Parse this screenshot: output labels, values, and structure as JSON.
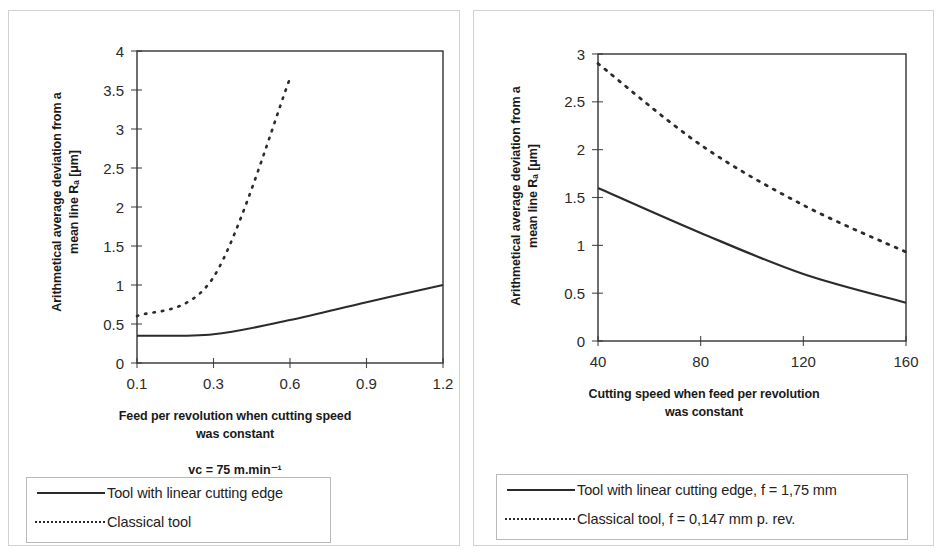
{
  "figure": {
    "panels": [
      {
        "id": "left",
        "y_axis_title_line1": "Arithmetical average deviation from a",
        "y_axis_title_line2": "mean line Rₐ [μm]",
        "x_axis_title_line1": "Feed per revolution when cutting speed",
        "x_axis_title_line2": "was constant",
        "condition_note": "vᴄ = 75 m.min⁻¹",
        "legend": [
          {
            "style": "solid",
            "label": "Tool with linear cutting edge"
          },
          {
            "style": "dashed",
            "label": "Classical tool"
          }
        ]
      },
      {
        "id": "right",
        "y_axis_title_line1": "Arithmetical average deviation from a",
        "y_axis_title_line2": "mean line Rₐ [μm]",
        "x_axis_title_line1": "Cutting speed when feed per revolution",
        "x_axis_title_line2": "was constant",
        "legend": [
          {
            "style": "solid",
            "label": "Tool with linear cutting edge, f = 1,75 mm"
          },
          {
            "style": "dashed",
            "label": "Classical tool, f = 0,147 mm p. rev."
          }
        ]
      }
    ]
  },
  "chart_data": [
    {
      "type": "line",
      "title": "",
      "xlabel": "Feed per revolution when cutting speed was constant",
      "ylabel": "Arithmetical average deviation from a mean line Ra [μm]",
      "categories": [
        "0.1",
        "0.3",
        "0.6",
        "0.9",
        "1.2"
      ],
      "xtick_labels": [
        "0.1",
        "0.3",
        "0.6",
        "0.9",
        "1.2"
      ],
      "ytick_labels": [
        "0",
        "0.5",
        "1",
        "1.5",
        "2",
        "2.5",
        "3",
        "3.5",
        "4"
      ],
      "ylim": [
        0,
        4
      ],
      "grid": false,
      "legend_position": "below",
      "series": [
        {
          "name": "Tool with linear cutting edge",
          "style": "solid",
          "color": "#2b2b2b",
          "x": [
            0.1,
            0.3,
            0.6,
            0.9,
            1.2
          ],
          "values": [
            0.35,
            0.37,
            0.55,
            0.78,
            1.0
          ]
        },
        {
          "name": "Classical tool",
          "style": "dashed",
          "color": "#2b2b2b",
          "x": [
            0.1,
            0.3,
            0.6
          ],
          "values": [
            0.6,
            1.1,
            3.65
          ]
        }
      ]
    },
    {
      "type": "line",
      "title": "",
      "xlabel": "Cutting speed when feed per revolution was constant",
      "ylabel": "Arithmetical average deviation from a mean line Ra [μm]",
      "categories": [
        "40",
        "80",
        "120",
        "160"
      ],
      "xtick_labels": [
        "40",
        "80",
        "120",
        "160"
      ],
      "ytick_labels": [
        "0",
        "0.5",
        "1",
        "1.5",
        "2",
        "2.5",
        "3"
      ],
      "ylim": [
        0,
        3
      ],
      "grid": false,
      "legend_position": "below",
      "series": [
        {
          "name": "Tool with linear cutting edge, f = 1,75 mm",
          "style": "solid",
          "color": "#2b2b2b",
          "x": [
            40,
            80,
            120,
            160
          ],
          "values": [
            1.6,
            1.13,
            0.7,
            0.4
          ]
        },
        {
          "name": "Classical tool, f = 0,147 mm p. rev.",
          "style": "dashed",
          "color": "#2b2b2b",
          "x": [
            40,
            80,
            120,
            160
          ],
          "values": [
            2.9,
            2.05,
            1.42,
            0.93
          ]
        }
      ]
    }
  ]
}
